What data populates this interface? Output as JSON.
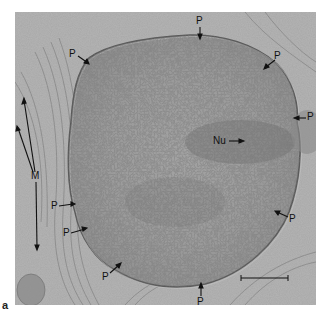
{
  "figure": {
    "panel_label": "a",
    "colors": {
      "background": "#ffffff",
      "tissue_base": "#a9a9a9",
      "nucleus": "#9a9a9a",
      "nucleolus": "#7d7d7d",
      "labels": "#111111"
    },
    "labels": {
      "pore": "P",
      "nucleolus": "Nu",
      "mitochondria": "M"
    },
    "pore_labels": [
      {
        "text": "P",
        "x": 69,
        "y": 49
      },
      {
        "text": "P",
        "x": 196,
        "y": 16
      },
      {
        "text": "P",
        "x": 274,
        "y": 50
      },
      {
        "text": "P",
        "x": 307,
        "y": 112
      },
      {
        "text": "P",
        "x": 289,
        "y": 213
      },
      {
        "text": "P",
        "x": 197,
        "y": 297
      },
      {
        "text": "P",
        "x": 102,
        "y": 273
      },
      {
        "text": "P",
        "x": 63,
        "y": 228
      },
      {
        "text": "P",
        "x": 51,
        "y": 201
      }
    ],
    "nucleolus_label": {
      "text": "Nu",
      "x": 213,
      "y": 136
    },
    "mitochondria_label": {
      "text": "M",
      "x": 33,
      "y": 170
    },
    "scale_bar": {
      "x1": 241,
      "x2": 288,
      "y": 278
    }
  }
}
